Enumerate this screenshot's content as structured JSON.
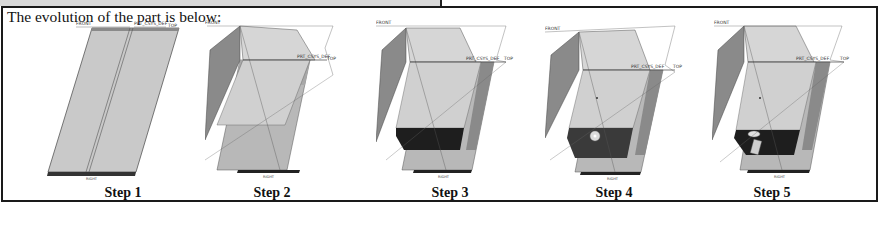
{
  "document": {
    "title": "The evolution of the part is below:",
    "steps": [
      {
        "caption": "Step 1",
        "labels": {
          "front": "FRONT",
          "csys": "PRT_CSYS_DEF",
          "top": "TOP",
          "right": "RIGHT"
        }
      },
      {
        "caption": "Step 2",
        "labels": {
          "front": "FRONT",
          "csys": "PRT_CSYS_DEF",
          "top": "TOP",
          "right": "RIGHT"
        }
      },
      {
        "caption": "Step 3",
        "labels": {
          "front": "FRONT",
          "csys": "PRT_CSYS_DEF",
          "top": "TOP",
          "right": "RIGHT"
        }
      },
      {
        "caption": "Step 4",
        "labels": {
          "front": "FRONT",
          "csys": "PRT_CSYS_DEF",
          "top": "TOP",
          "right": "RIGHT"
        }
      },
      {
        "caption": "Step 5",
        "labels": {
          "front": "FRONT",
          "csys": "PRT_CSYS_DEF",
          "top": "TOP",
          "right": "RIGHT"
        }
      }
    ]
  },
  "colors": {
    "panel_light": "#c8c8c8",
    "panel_mid": "#9a9a9a",
    "panel_dark": "#7a7a7a",
    "base_black": "#1e1e1e",
    "frame": "#1a1a1a"
  }
}
